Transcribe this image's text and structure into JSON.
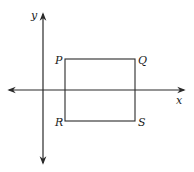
{
  "diagram": {
    "type": "coordinate-plane-rectangle",
    "colors": {
      "stroke": "#2a2a2a",
      "text": "#1a1a1a",
      "background": "#ffffff"
    },
    "axes": {
      "x": {
        "label": "x",
        "from": [
          7,
          90
        ],
        "to": [
          186,
          90
        ],
        "arrows": "both"
      },
      "y": {
        "label": "y",
        "from": [
          43,
          165
        ],
        "to": [
          43,
          12
        ],
        "arrows": "both"
      }
    },
    "rectangle": {
      "vertices": {
        "P": {
          "label": "P",
          "pos": [
            65,
            59
          ]
        },
        "Q": {
          "label": "Q",
          "pos": [
            135,
            59
          ]
        },
        "R": {
          "label": "R",
          "pos": [
            65,
            121
          ]
        },
        "S": {
          "label": "S",
          "pos": [
            135,
            121
          ]
        }
      }
    }
  }
}
